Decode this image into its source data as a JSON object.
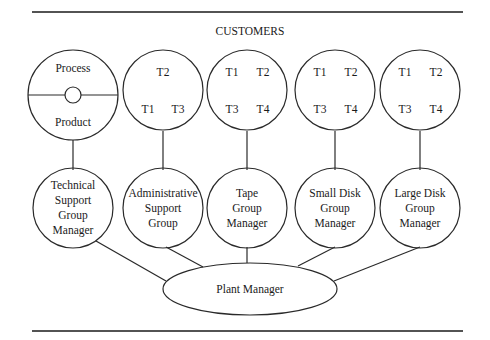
{
  "diagram": {
    "title": "CUSTOMERS",
    "top_nodes": [
      {
        "id": "process-product",
        "upper_label": "Process",
        "lower_label": "Product"
      },
      {
        "id": "admin-teams",
        "labels": [
          "T2",
          "T1",
          "T3"
        ]
      },
      {
        "id": "tape-teams",
        "labels": [
          "T1",
          "T2",
          "T3",
          "T4"
        ]
      },
      {
        "id": "small-disk-teams",
        "labels": [
          "T1",
          "T2",
          "T3",
          "T4"
        ]
      },
      {
        "id": "large-disk-teams",
        "labels": [
          "T1",
          "T2",
          "T3",
          "T4"
        ]
      }
    ],
    "group_nodes": [
      {
        "id": "technical-support",
        "lines": [
          "Technical",
          "Support",
          "Group",
          "Manager"
        ]
      },
      {
        "id": "administrative-support",
        "lines": [
          "Administrative",
          "Support",
          "Group"
        ]
      },
      {
        "id": "tape-group",
        "lines": [
          "Tape",
          "Group",
          "Manager"
        ]
      },
      {
        "id": "small-disk-group",
        "lines": [
          "Small Disk",
          "Group",
          "Manager"
        ]
      },
      {
        "id": "large-disk-group",
        "lines": [
          "Large Disk",
          "Group",
          "Manager"
        ]
      }
    ],
    "root_node": {
      "label": "Plant Manager"
    },
    "colors": {
      "stroke": "#2a2a2a",
      "text": "#1a1a1a",
      "background": "#ffffff"
    }
  }
}
